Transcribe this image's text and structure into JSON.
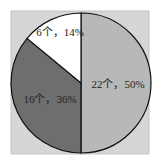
{
  "chart_data": {
    "type": "pie",
    "title": "",
    "slices": [
      {
        "label": "22个，50%",
        "count": 22,
        "percent": 50,
        "color": "#b8b8b8"
      },
      {
        "label": "16个，36%",
        "count": 16,
        "percent": 36,
        "color": "#6e6e6e"
      },
      {
        "label": "6个，14%",
        "count": 6,
        "percent": 14,
        "color": "#ffffff"
      }
    ],
    "start_angle_deg": 0,
    "direction": "clockwise-from-top",
    "legend": "none",
    "background": "#d4d4d4",
    "border": "#c8c8c8"
  }
}
